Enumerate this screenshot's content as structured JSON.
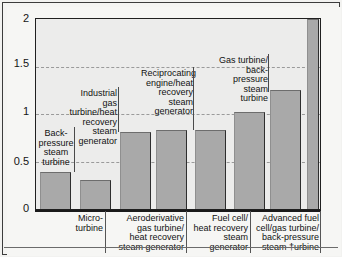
{
  "chart_data": {
    "type": "bar",
    "title": "",
    "xlabel": "",
    "ylabel": "",
    "ylim": [
      0,
      2
    ],
    "yticks": [
      "0",
      "0.5",
      "1",
      "1.5",
      "2"
    ],
    "ytick_values": [
      0,
      0.5,
      1,
      1.5,
      2
    ],
    "grid": true,
    "grid_style": "dashed horizontal",
    "legend": "none",
    "categories": [
      "Back-pressure steam turbine",
      "Micro-turbine",
      "Industrial gas turbine/heat recovery steam generator",
      "Aeroderivative gas turbine/heat recovery steam generator",
      "Reciprocating engine/heat recovery steam generator",
      "Fuel cell/heat recovery steam generator",
      "Gas turbine/back-pressure steam turbine",
      "Advanced fuel cell/gas turbine/back-pressure steam turbine"
    ],
    "values": [
      0.39,
      0.31,
      0.81,
      0.83,
      0.83,
      1.02,
      1.25,
      2.0
    ],
    "bar_color": "#a9a9a9",
    "bars": [
      {
        "label": "Back-pressure steam turbine",
        "value": 0.39,
        "label_position": "inside-above"
      },
      {
        "label": "Micro-turbine",
        "value": 0.31,
        "label_position": "below-axis"
      },
      {
        "label": "Industrial gas turbine/heat recovery steam generator",
        "value": 0.81,
        "label_position": "inside-above"
      },
      {
        "label": "Aeroderivative gas turbine/heat recovery steam generator",
        "value": 0.83,
        "label_position": "below-axis"
      },
      {
        "label": "Reciprocating engine/heat recovery steam generator",
        "value": 0.83,
        "label_position": "inside-above"
      },
      {
        "label": "Fuel cell/heat recovery steam generator",
        "value": 1.02,
        "label_position": "below-axis"
      },
      {
        "label": "Gas turbine/back-pressure steam turbine",
        "value": 1.25,
        "label_position": "inside-above"
      },
      {
        "label": "Advanced fuel cell/gas turbine/back-pressure steam turbine",
        "value": 2.0,
        "label_position": "below-axis"
      }
    ]
  },
  "axis": {
    "y": {
      "t0": "0",
      "t05": "0.5",
      "t1": "1",
      "t15": "1.5",
      "t2": "2"
    }
  },
  "callouts": {
    "back_pressure_steam_turbine": "Back-\npressure\nsteam\nturbine",
    "industrial_gas_turbine": "Industrial gas\nturbine/heat\nrecovery steam\ngenerator",
    "reciprocating_engine": "Reciprocating\nengine/heat\nrecovery steam\ngenerator",
    "gas_turbine_back_pressure": "Gas turbine/\nback-pressure\nsteam turbine"
  },
  "xlabels": {
    "micro_turbine": "Micro-\nturbine",
    "aeroderivative": "Aeroderivative\ngas turbine/\nheat recovery\nsteam generator",
    "fuel_cell_hrsg": "Fuel cell/\nheat recovery\nsteam\ngenerator",
    "advanced_fuel_cell": "Advanced fuel\ncell/gas turbine/\nback-pressure\nsteam †urbine"
  }
}
